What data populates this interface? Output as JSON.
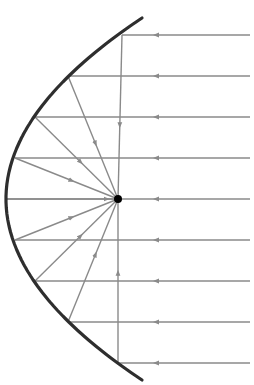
{
  "diagram": {
    "colors": {
      "mirror": "#2e2e2e",
      "ray": "#8a8a8a",
      "focus": "#000000",
      "background": "#ffffff"
    },
    "focus": {
      "x": 118,
      "y": 199,
      "r": 4
    },
    "mirror": {
      "x_top": 142,
      "y_top": 18,
      "x_bottom": 136,
      "y_bottom": 380,
      "vertex_x": 6,
      "vertex_y": 199
    },
    "rays": [
      {
        "y": 35,
        "hit_x": 122
      },
      {
        "y": 76,
        "hit_x": 68
      },
      {
        "y": 117,
        "hit_x": 35
      },
      {
        "y": 158,
        "hit_x": 15
      },
      {
        "y": 199,
        "hit_x": 7
      },
      {
        "y": 240,
        "hit_x": 15
      },
      {
        "y": 281,
        "hit_x": 35
      },
      {
        "y": 322,
        "hit_x": 68
      },
      {
        "y": 363,
        "hit_x": 118
      }
    ],
    "ray_start_x": 250,
    "incoming_arrow_x": 156
  }
}
